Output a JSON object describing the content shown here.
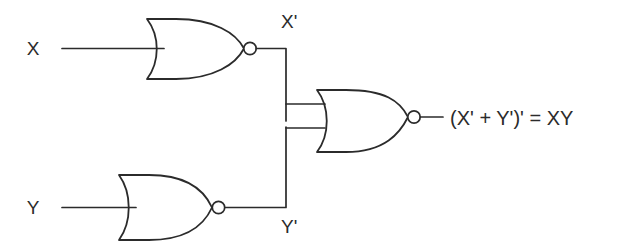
{
  "diagram": {
    "background_color": "#ffffff",
    "line_color": "#2b2b2b",
    "inputs": [
      {
        "id": "input-x",
        "label": "X"
      },
      {
        "id": "input-y",
        "label": "Y"
      }
    ],
    "nodes": [
      {
        "id": "node-x-prime",
        "label": "X'"
      },
      {
        "id": "node-y-prime",
        "label": "Y'"
      }
    ],
    "gates": [
      {
        "id": "gate-nor-top",
        "type": "NOR",
        "inputs": [
          "X"
        ],
        "output": "X'"
      },
      {
        "id": "gate-nor-bottom",
        "type": "NOR",
        "inputs": [
          "Y"
        ],
        "output": "Y'"
      },
      {
        "id": "gate-nor-output",
        "type": "NOR",
        "inputs": [
          "X'",
          "Y'"
        ],
        "output": "(X' + Y')' = XY"
      }
    ],
    "output": {
      "id": "output-expression",
      "label": "(X' + Y')' = XY"
    }
  }
}
